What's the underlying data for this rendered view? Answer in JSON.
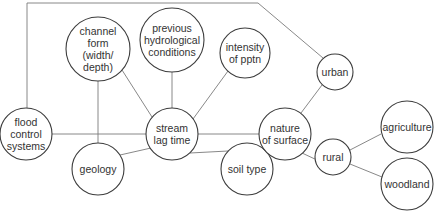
{
  "diagram": {
    "type": "concept-map",
    "central_node": "stream lag time",
    "nodes": [
      {
        "id": "flood",
        "lines": [
          "flood",
          "control",
          "systems"
        ],
        "cx": 26,
        "cy": 134,
        "r": 26
      },
      {
        "id": "channel",
        "lines": [
          "channel",
          "form",
          "(width/",
          "depth)"
        ],
        "cx": 98,
        "cy": 49,
        "r": 32
      },
      {
        "id": "previous",
        "lines": [
          "previous",
          "hydrological",
          "conditions"
        ],
        "cx": 172,
        "cy": 40,
        "r": 32
      },
      {
        "id": "intensity",
        "lines": [
          "intensity",
          "of pptn"
        ],
        "cx": 245,
        "cy": 53,
        "r": 25
      },
      {
        "id": "stream",
        "lines": [
          "stream",
          "lag time"
        ],
        "cx": 172,
        "cy": 134,
        "r": 26
      },
      {
        "id": "geology",
        "lines": [
          "geology"
        ],
        "cx": 98,
        "cy": 169,
        "r": 26
      },
      {
        "id": "soil",
        "lines": [
          "soil type"
        ],
        "cx": 247,
        "cy": 169,
        "r": 26
      },
      {
        "id": "urban",
        "lines": [
          "urban"
        ],
        "cx": 335,
        "cy": 72,
        "r": 18
      },
      {
        "id": "nature",
        "lines": [
          "nature",
          "of surface"
        ],
        "cx": 285,
        "cy": 134,
        "r": 26
      },
      {
        "id": "rural",
        "lines": [
          "rural"
        ],
        "cx": 333,
        "cy": 157,
        "r": 18
      },
      {
        "id": "agriculture",
        "lines": [
          "agriculture"
        ],
        "cx": 407,
        "cy": 127,
        "r": 26
      },
      {
        "id": "woodland",
        "lines": [
          "woodland"
        ],
        "cx": 407,
        "cy": 184,
        "r": 26
      }
    ],
    "edges": [
      {
        "from": "flood",
        "to": "stream",
        "points": [
          [
            52,
            134
          ],
          [
            146,
            134
          ]
        ]
      },
      {
        "from": "channel",
        "to": "geology",
        "points": [
          [
            98,
            81
          ],
          [
            98,
            143
          ]
        ]
      },
      {
        "from": "channel",
        "to": "stream",
        "points": [
          [
            122,
            70
          ],
          [
            152,
            117
          ]
        ]
      },
      {
        "from": "previous",
        "to": "stream",
        "points": [
          [
            172,
            72
          ],
          [
            172,
            108
          ]
        ]
      },
      {
        "from": "intensity",
        "to": "stream",
        "points": [
          [
            228,
            71
          ],
          [
            193,
            119
          ]
        ]
      },
      {
        "from": "geology",
        "to": "stream",
        "points": [
          [
            120,
            155
          ],
          [
            151,
            148
          ]
        ]
      },
      {
        "from": "soil",
        "to": "stream",
        "points": [
          [
            228,
            151
          ],
          [
            190,
            153
          ]
        ]
      },
      {
        "from": "stream",
        "to": "nature",
        "points": [
          [
            198,
            134
          ],
          [
            259,
            134
          ]
        ]
      },
      {
        "from": "nature",
        "to": "urban",
        "points": [
          [
            301,
            113
          ],
          [
            322,
            85
          ]
        ]
      },
      {
        "from": "nature",
        "to": "rural",
        "points": [
          [
            302,
            153
          ],
          [
            317,
            160
          ]
        ]
      },
      {
        "from": "rural",
        "to": "agriculture",
        "points": [
          [
            350,
            150
          ],
          [
            381,
            134
          ]
        ]
      },
      {
        "from": "rural",
        "to": "woodland",
        "points": [
          [
            350,
            164
          ],
          [
            382,
            177
          ]
        ]
      },
      {
        "from": "flood",
        "to": "urban",
        "points": [
          [
            27,
            108
          ],
          [
            27,
            3
          ],
          [
            258,
            3
          ],
          [
            323,
            58
          ]
        ]
      }
    ]
  }
}
